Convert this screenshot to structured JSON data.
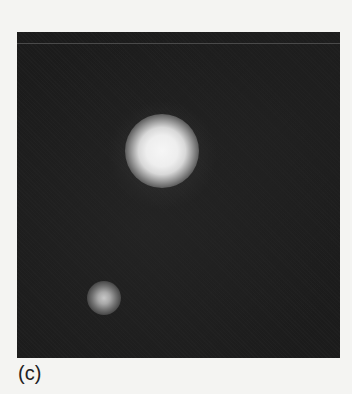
{
  "figure": {
    "panel_label": "(c)",
    "image": {
      "description": "grayscale fluorescence microscopy image on dark background",
      "background_color": "#1c1c1c",
      "spots": [
        {
          "name": "large-bright-spot",
          "center_x": 162,
          "center_y": 150,
          "radius": 25
        },
        {
          "name": "small-dim-spot",
          "center_x": 103,
          "center_y": 297,
          "radius": 12
        }
      ]
    }
  }
}
